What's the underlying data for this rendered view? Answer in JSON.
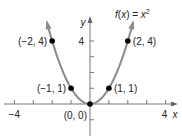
{
  "chart_data": {
    "type": "line",
    "function_label": {
      "prefix": "f(",
      "var": "x",
      "mid": ") = ",
      "base": "x",
      "exp": "2"
    },
    "xlabel": "x",
    "ylabel": "y",
    "xlim": [
      -4,
      4
    ],
    "ylim": [
      -1,
      5
    ],
    "x_tick_labels": [
      {
        "value": -4,
        "label": "−4"
      },
      {
        "value": 4,
        "label": "4"
      }
    ],
    "y_tick_labels": [
      {
        "value": 4,
        "label": "4"
      }
    ],
    "x_ticks": [
      -4,
      -3,
      -2,
      -1,
      1,
      2,
      3,
      4
    ],
    "y_ticks": [
      -1,
      1,
      2,
      3,
      4
    ],
    "grid": false,
    "curve_color": "#8a8a8a",
    "point_color": "#000000",
    "series": [
      {
        "name": "f(x) = x^2",
        "x": [
          -2.28,
          -2,
          -1,
          0,
          1,
          2,
          2.28
        ],
        "y": [
          5.2,
          4,
          1,
          0,
          1,
          4,
          5.2
        ]
      }
    ],
    "points": [
      {
        "x": -2,
        "y": 4,
        "label": "(−2, 4)",
        "side": "left"
      },
      {
        "x": -1,
        "y": 1,
        "label": "(−1, 1)",
        "side": "left"
      },
      {
        "x": 0,
        "y": 0,
        "label": "(0, 0)",
        "side": "below-left"
      },
      {
        "x": 1,
        "y": 1,
        "label": "(1, 1)",
        "side": "right"
      },
      {
        "x": 2,
        "y": 4,
        "label": "(2, 4)",
        "side": "right"
      }
    ]
  }
}
